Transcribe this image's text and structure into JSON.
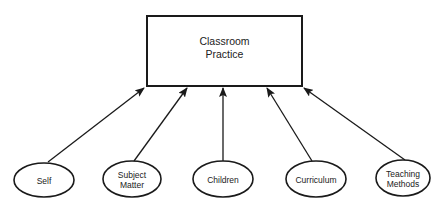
{
  "diagram": {
    "target": {
      "lines": [
        "Classroom",
        "Practice"
      ],
      "x": 147,
      "y": 16,
      "width": 155,
      "height": 70
    },
    "nodes": [
      {
        "id": "self",
        "lines": [
          "Self"
        ],
        "cx": 44,
        "cy": 180,
        "rx": 30,
        "ry": 17
      },
      {
        "id": "subject-matter",
        "lines": [
          "Subject",
          "Matter"
        ],
        "cx": 132,
        "cy": 179,
        "rx": 29,
        "ry": 18
      },
      {
        "id": "children",
        "lines": [
          "Children"
        ],
        "cx": 223,
        "cy": 179,
        "rx": 30,
        "ry": 18
      },
      {
        "id": "curriculum",
        "lines": [
          "Curriculum"
        ],
        "cx": 316,
        "cy": 179,
        "rx": 30,
        "ry": 18
      },
      {
        "id": "teaching-methods",
        "lines": [
          "Teaching",
          "Methods"
        ],
        "cx": 403,
        "cy": 178,
        "rx": 27,
        "ry": 18
      }
    ],
    "arrows": [
      {
        "from": "self",
        "x1": 48,
        "y1": 162,
        "x2": 144,
        "y2": 88
      },
      {
        "from": "subject-matter",
        "x1": 134,
        "y1": 161,
        "x2": 187,
        "y2": 88
      },
      {
        "from": "children",
        "x1": 223,
        "y1": 161,
        "x2": 223,
        "y2": 88
      },
      {
        "from": "curriculum",
        "x1": 312,
        "y1": 161,
        "x2": 267,
        "y2": 88
      },
      {
        "from": "teaching-methods",
        "x1": 405,
        "y1": 160,
        "x2": 304,
        "y2": 88
      }
    ],
    "stroke_color": "#1a1a1a"
  }
}
